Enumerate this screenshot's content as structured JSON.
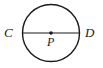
{
  "figure": {
    "name": "circle-with-diameter",
    "background_color": "#ffffff",
    "stroke_color": "#1a1a1a",
    "canvas": {
      "width": 103,
      "height": 68
    }
  },
  "shapes": {
    "circle": {
      "name": "circle",
      "center_x": 51,
      "center_y": 33,
      "radius": 28.5,
      "stroke_width": 1.4,
      "fill": "none",
      "stroke": "#1a1a1a"
    },
    "diameter": {
      "name": "diameter-segment-CD",
      "x1": 22.5,
      "y1": 33,
      "x2": 79.5,
      "y2": 33,
      "stroke_width": 1.1,
      "stroke": "#1a1a1a"
    },
    "center_point": {
      "name": "center-point-P",
      "cx": 51,
      "cy": 33,
      "r": 1.8,
      "fill": "#1a1a1a"
    }
  },
  "labels": {
    "left_endpoint": "C",
    "right_endpoint": "D",
    "center": "P"
  }
}
